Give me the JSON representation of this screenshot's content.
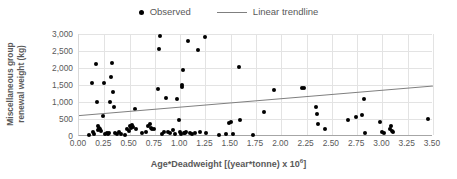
{
  "chart_data": {
    "type": "scatter",
    "title": "",
    "xlabel": "Age*Deadweight [(year*tonne) x 10^6]",
    "xlabel_prefix": "Age*Deadweight [(year*tonne) x 10",
    "xlabel_superscript": "6",
    "xlabel_suffix": "]",
    "ylabel": "Miscellaneous group renewal weight (kg)",
    "ylabel_line1": "Miscellaneous group",
    "ylabel_line2": "renewal weight (kg)",
    "xlim": [
      0.0,
      3.5
    ],
    "ylim": [
      0,
      3000
    ],
    "xticks": [
      "0.00",
      "0.25",
      "0.50",
      "0.75",
      "1.00",
      "1.25",
      "1.50",
      "1.75",
      "2.00",
      "2.25",
      "2.50",
      "2.75",
      "3.00",
      "3.25",
      "3.50"
    ],
    "xtick_values": [
      0.0,
      0.25,
      0.5,
      0.75,
      1.0,
      1.25,
      1.5,
      1.75,
      2.0,
      2.25,
      2.5,
      2.75,
      3.0,
      3.25,
      3.5
    ],
    "yticks": [
      "0",
      "500",
      "1,000",
      "1,500",
      "2,000",
      "2,500",
      "3,000"
    ],
    "ytick_values": [
      0,
      500,
      1000,
      1500,
      2000,
      2500,
      3000
    ],
    "grid": true,
    "grid_color": "#e3e3e3",
    "legend_position": "top-center",
    "marker_color": "#000000",
    "trendline_color": "#7f7f7f",
    "legend": [
      {
        "label": "Observed",
        "type": "marker",
        "color": "#000000"
      },
      {
        "label": "Linear trendline",
        "type": "line",
        "color": "#7f7f7f"
      }
    ],
    "series": [
      {
        "name": "Observed",
        "type": "scatter",
        "points": [
          [
            0.1,
            30
          ],
          [
            0.13,
            1550
          ],
          [
            0.14,
            120
          ],
          [
            0.15,
            60
          ],
          [
            0.17,
            2110
          ],
          [
            0.18,
            1010
          ],
          [
            0.19,
            280
          ],
          [
            0.19,
            180
          ],
          [
            0.2,
            250
          ],
          [
            0.21,
            200
          ],
          [
            0.22,
            160
          ],
          [
            0.24,
            590
          ],
          [
            0.25,
            1550
          ],
          [
            0.26,
            70
          ],
          [
            0.28,
            80
          ],
          [
            0.29,
            60
          ],
          [
            0.3,
            100
          ],
          [
            0.31,
            1010
          ],
          [
            0.32,
            1740
          ],
          [
            0.33,
            2140
          ],
          [
            0.34,
            1300
          ],
          [
            0.35,
            860
          ],
          [
            0.36,
            90
          ],
          [
            0.38,
            70
          ],
          [
            0.4,
            110
          ],
          [
            0.42,
            60
          ],
          [
            0.45,
            30
          ],
          [
            0.47,
            200
          ],
          [
            0.49,
            150
          ],
          [
            0.5,
            290
          ],
          [
            0.51,
            250
          ],
          [
            0.52,
            310
          ],
          [
            0.53,
            270
          ],
          [
            0.55,
            800
          ],
          [
            0.56,
            220
          ],
          [
            0.62,
            90
          ],
          [
            0.66,
            120
          ],
          [
            0.68,
            280
          ],
          [
            0.7,
            340
          ],
          [
            0.71,
            250
          ],
          [
            0.72,
            220
          ],
          [
            0.74,
            200
          ],
          [
            0.78,
            1370
          ],
          [
            0.79,
            2550
          ],
          [
            0.8,
            2940
          ],
          [
            0.82,
            60
          ],
          [
            0.84,
            110
          ],
          [
            0.86,
            1110
          ],
          [
            0.88,
            120
          ],
          [
            0.9,
            90
          ],
          [
            0.93,
            190
          ],
          [
            0.95,
            70
          ],
          [
            0.97,
            1080
          ],
          [
            0.99,
            460
          ],
          [
            1.0,
            120
          ],
          [
            1.01,
            60
          ],
          [
            1.02,
            1500
          ],
          [
            1.02,
            1450
          ],
          [
            1.03,
            1940
          ],
          [
            1.04,
            90
          ],
          [
            1.05,
            80
          ],
          [
            1.06,
            110
          ],
          [
            1.08,
            2800
          ],
          [
            1.1,
            100
          ],
          [
            1.12,
            70
          ],
          [
            1.15,
            90
          ],
          [
            1.18,
            2540
          ],
          [
            1.2,
            110
          ],
          [
            1.25,
            2920
          ],
          [
            1.26,
            100
          ],
          [
            1.38,
            40
          ],
          [
            1.45,
            60
          ],
          [
            1.48,
            390
          ],
          [
            1.5,
            410
          ],
          [
            1.52,
            70
          ],
          [
            1.58,
            2030
          ],
          [
            1.59,
            460
          ],
          [
            1.72,
            40
          ],
          [
            1.83,
            700
          ],
          [
            1.93,
            1350
          ],
          [
            2.2,
            1420
          ],
          [
            2.22,
            1400
          ],
          [
            2.34,
            840
          ],
          [
            2.35,
            650
          ],
          [
            2.36,
            350
          ],
          [
            2.43,
            200
          ],
          [
            2.66,
            470
          ],
          [
            2.74,
            560
          ],
          [
            2.8,
            630
          ],
          [
            2.82,
            1090
          ],
          [
            2.83,
            80
          ],
          [
            2.98,
            410
          ],
          [
            3.0,
            120
          ],
          [
            3.02,
            100
          ],
          [
            3.07,
            220
          ],
          [
            3.08,
            300
          ],
          [
            3.09,
            140
          ],
          [
            3.1,
            110
          ],
          [
            3.45,
            510
          ]
        ]
      },
      {
        "name": "Linear trendline",
        "type": "line",
        "points": [
          [
            0.0,
            600
          ],
          [
            3.5,
            1470
          ]
        ]
      }
    ]
  }
}
